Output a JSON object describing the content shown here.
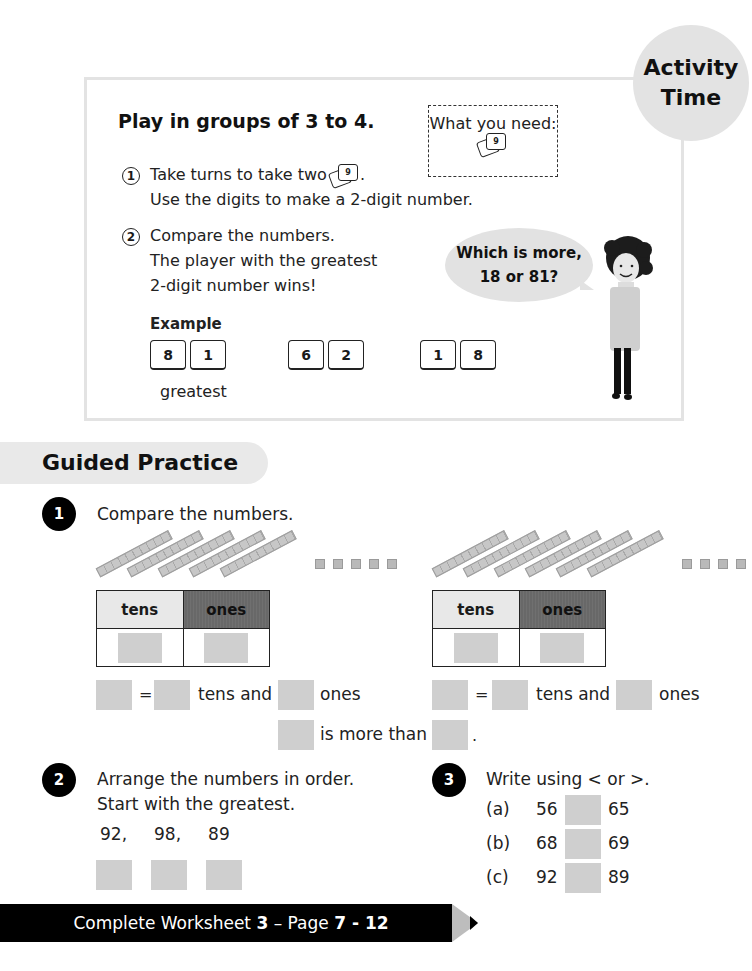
{
  "activity": {
    "badge_line1": "Activity",
    "badge_line2": "Time",
    "title": "Play in groups of 3 to 4.",
    "what_you_need_label": "What you need:",
    "card_icon_digit": "9",
    "steps": [
      {
        "num": "1",
        "lines": [
          "Take turns to take two",
          "Use the digits to make a 2-digit number."
        ]
      },
      {
        "num": "2",
        "lines": [
          "Compare the numbers.",
          "The player with the greatest",
          "2-digit number wins!"
        ]
      }
    ],
    "speech_bubble": [
      "Which is more,",
      "18 or 81?"
    ],
    "example_label": "Example",
    "example_pairs": [
      [
        "8",
        "1"
      ],
      [
        "6",
        "2"
      ],
      [
        "1",
        "8"
      ]
    ],
    "greatest_label": "greatest"
  },
  "guided_practice": {
    "title": "Guided Practice",
    "q1": {
      "num": "1",
      "prompt": "Compare the numbers.",
      "left": {
        "tens_rods": 5,
        "ones_cubes": 5
      },
      "right": {
        "tens_rods": 6,
        "ones_cubes": 4
      },
      "table_headers": [
        "tens",
        "ones"
      ],
      "equals": "=",
      "tens_and": "tens and",
      "ones": "ones",
      "is_more_than": "is more than",
      "period": "."
    },
    "q2": {
      "num": "2",
      "prompt_line1": "Arrange the numbers in order.",
      "prompt_line2": "Start with the greatest.",
      "numbers": "92,     98,     89"
    },
    "q3": {
      "num": "3",
      "prompt": "Write using < or >.",
      "items": [
        {
          "label": "(a)",
          "left": "56",
          "right": "65"
        },
        {
          "label": "(b)",
          "left": "68",
          "right": "69"
        },
        {
          "label": "(c)",
          "left": "92",
          "right": "89"
        }
      ]
    }
  },
  "footer": {
    "prefix": "Complete Worksheet ",
    "worksheet": "3",
    "mid": " – Page ",
    "pages": "7 - 12"
  }
}
